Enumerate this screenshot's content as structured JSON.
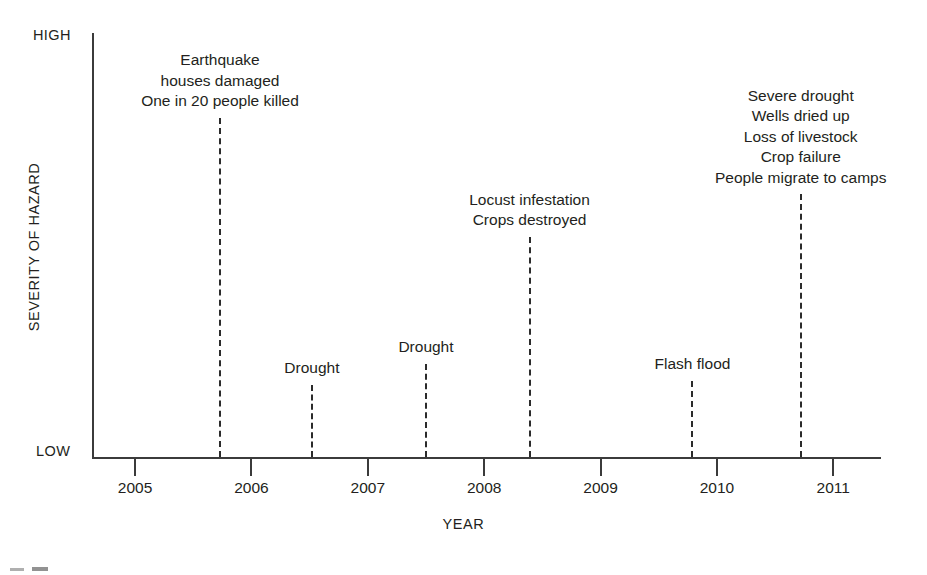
{
  "chart_data": {
    "type": "scatter",
    "title": "",
    "xlabel": "YEAR",
    "ylabel": "SEVERITY OF HAZARD",
    "xlim": [
      2004.63,
      2011.41
    ],
    "ylim": [
      "LOW",
      "HIGH"
    ],
    "grid": false,
    "legend": null,
    "y_axis_captions": {
      "high": "HIGH",
      "low": "LOW"
    },
    "x_ticks": [
      {
        "label": "2005",
        "value": 2005
      },
      {
        "label": "2006",
        "value": 2006
      },
      {
        "label": "2007",
        "value": 2007
      },
      {
        "label": "2008",
        "value": 2008
      },
      {
        "label": "2009",
        "value": 2009
      },
      {
        "label": "2010",
        "value": 2010
      },
      {
        "label": "2011",
        "value": 2011
      }
    ],
    "events": [
      {
        "name": "earthquake",
        "x": 2005.73,
        "severity_pct": 80,
        "lines": [
          "Earthquake",
          "houses damaged",
          "One in 20 people killed"
        ]
      },
      {
        "name": "drought-2006",
        "x": 2006.52,
        "severity_pct": 17,
        "lines": [
          "Drought"
        ]
      },
      {
        "name": "drought-2007",
        "x": 2007.5,
        "severity_pct": 22,
        "lines": [
          "Drought"
        ]
      },
      {
        "name": "locust-infestation",
        "x": 2008.39,
        "severity_pct": 52,
        "lines": [
          "Locust infestation",
          "Crops destroyed"
        ]
      },
      {
        "name": "flash-flood",
        "x": 2009.79,
        "severity_pct": 18,
        "lines": [
          "Flash flood"
        ]
      },
      {
        "name": "severe-drought",
        "x": 2010.72,
        "severity_pct": 62,
        "lines": [
          "Severe drought",
          "Wells dried up",
          "Loss of livestock",
          "Crop failure",
          "People migrate to camps"
        ]
      }
    ]
  }
}
